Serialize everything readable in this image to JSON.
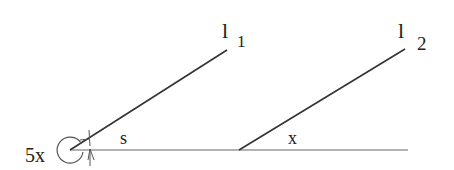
{
  "diagram": {
    "type": "geometry-parallel-lines",
    "lines": [
      {
        "id": "l1",
        "label_main": "l",
        "label_sub": "1"
      },
      {
        "id": "l2",
        "label_main": "l",
        "label_sub": "2"
      }
    ],
    "transversal": "horizontal baseline",
    "angles": {
      "reflex_angle_label": "5x",
      "angle_s_label": "s",
      "angle_x_label": "x"
    }
  }
}
